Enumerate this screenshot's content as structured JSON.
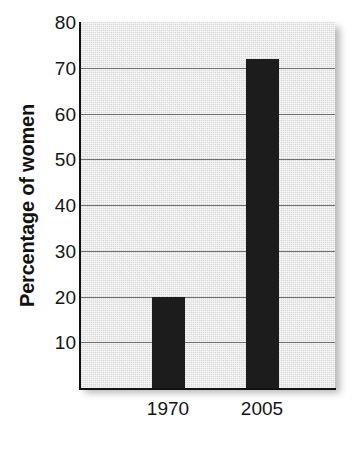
{
  "chart_data": {
    "type": "bar",
    "title": "",
    "xlabel": "",
    "ylabel": "Percentage of women",
    "categories": [
      "1970",
      "2005"
    ],
    "values": [
      20,
      72
    ],
    "series": [
      {
        "name": "Percentage of women",
        "values": [
          20,
          72
        ]
      }
    ],
    "ylim": [
      0,
      80
    ],
    "yticks": [
      10,
      20,
      30,
      40,
      50,
      60,
      70,
      80
    ],
    "ytick_labels": [
      "10",
      "20",
      "30",
      "40",
      "50",
      "60",
      "70",
      "80"
    ],
    "grid": "horizontal",
    "legend": "none",
    "colors": {
      "bar": "#1c1c1c",
      "plot_background": "#dddddd",
      "gridline": "#6f6f6f",
      "axis": "#111111",
      "text": "#151515",
      "page_background": "#ffffff"
    }
  }
}
